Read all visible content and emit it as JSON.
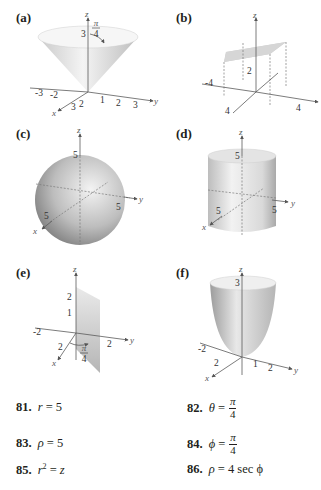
{
  "panels": [
    {
      "id": "a",
      "label": "(a)",
      "surface": "cone",
      "axis_labels": {
        "x": "x",
        "y": "y",
        "z": "z"
      },
      "tick_labels": {
        "neg_y": [
          "-3",
          "-2"
        ],
        "pos_y": [
          "1",
          "2",
          "3"
        ],
        "x": [
          "3",
          "2"
        ],
        "z": [
          "3"
        ]
      },
      "annotation": {
        "numerator": "π",
        "denominator": "4"
      }
    },
    {
      "id": "b",
      "label": "(b)",
      "surface": "horizontal-plane",
      "axis_labels": {
        "x": "",
        "y": "",
        "z": "z"
      },
      "tick_labels": {
        "neg_y": [
          "-4"
        ],
        "pos_y": [
          "4"
        ],
        "x": [
          "4"
        ],
        "z": [
          "2"
        ]
      }
    },
    {
      "id": "c",
      "label": "(c)",
      "surface": "sphere",
      "axis_labels": {
        "x": "x",
        "y": "y",
        "z": "z"
      },
      "tick_labels": {
        "x": [
          "5"
        ],
        "y": [
          "5"
        ],
        "z": [
          "5"
        ]
      }
    },
    {
      "id": "d",
      "label": "(d)",
      "surface": "cylinder",
      "axis_labels": {
        "x": "x",
        "y": "y",
        "z": "z"
      },
      "tick_labels": {
        "x": [
          "5"
        ],
        "y": [
          "5"
        ],
        "z": [
          "5"
        ]
      }
    },
    {
      "id": "e",
      "label": "(e)",
      "surface": "vertical-half-plane",
      "axis_labels": {
        "x": "x",
        "y": "y",
        "z": "z"
      },
      "tick_labels": {
        "neg_y": [
          "-2"
        ],
        "pos_y": [
          "2"
        ],
        "x": [
          "2"
        ],
        "z": [
          "2",
          "1"
        ]
      },
      "annotation": {
        "numerator": "π",
        "denominator": "4"
      }
    },
    {
      "id": "f",
      "label": "(f)",
      "surface": "paraboloid",
      "axis_labels": {
        "x": "x",
        "y": "y",
        "z": "z"
      },
      "tick_labels": {
        "neg_y": [
          "-2"
        ],
        "pos_y": [
          "1",
          "2"
        ],
        "x": [
          "2"
        ],
        "z": [
          "3"
        ]
      }
    }
  ],
  "exercises": [
    {
      "number": "81.",
      "lhs": "r",
      "rhs": "5"
    },
    {
      "number": "82.",
      "lhs": "θ",
      "rhs_numerator": "π",
      "rhs_denominator": "4"
    },
    {
      "number": "83.",
      "lhs": "ρ",
      "rhs": "5"
    },
    {
      "number": "84.",
      "lhs": "ϕ",
      "rhs_numerator": "π",
      "rhs_denominator": "4"
    },
    {
      "number": "85.",
      "lhs": "r",
      "lhs_sup": "2",
      "rhs": "z"
    },
    {
      "number": "86.",
      "lhs": "ρ",
      "rhs": "4 sec ϕ"
    }
  ],
  "colors": {
    "text": "#231f20",
    "surface_light": "#f2f2f2",
    "surface_mid": "#cfcfcf",
    "surface_dark": "#9a9a9a",
    "axis": "#5a5a5a"
  }
}
